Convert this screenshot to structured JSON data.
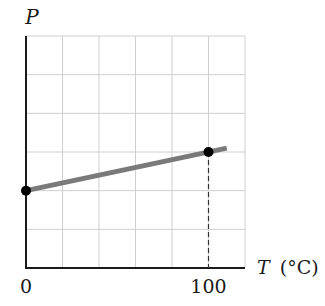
{
  "chart_data": {
    "type": "line",
    "title": "",
    "xlabel_var": "T",
    "xlabel_unit": "(°C)",
    "ylabel": "P",
    "xlim": [
      0,
      120
    ],
    "ylim": [
      0,
      6
    ],
    "grid": true,
    "x_ticks": [
      {
        "value": 0,
        "label": "0"
      },
      {
        "value": 100,
        "label": "100"
      }
    ],
    "series": [
      {
        "name": "P vs T",
        "color": "#7a7a7a",
        "x": [
          0,
          110
        ],
        "y": [
          2,
          3.1
        ]
      }
    ],
    "points": [
      {
        "x": 0,
        "y": 2
      },
      {
        "x": 100,
        "y": 3
      }
    ],
    "dashed_drop": {
      "x": 100,
      "y": 3
    },
    "colors": {
      "axis": "#1a1a1a",
      "grid": "#cfcfcf",
      "line": "#7a7a7a",
      "point": "#000000"
    }
  }
}
